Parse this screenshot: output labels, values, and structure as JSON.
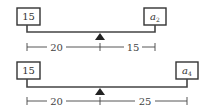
{
  "diagrams": [
    {
      "left_weight": "15",
      "right_weight": {
        "base": "a",
        "sub": "2"
      },
      "left_distance": "20",
      "right_distance": "15"
    },
    {
      "left_weight": "15",
      "right_weight": {
        "base": "a",
        "sub": "4"
      },
      "left_distance": "20",
      "right_distance": "25"
    }
  ]
}
